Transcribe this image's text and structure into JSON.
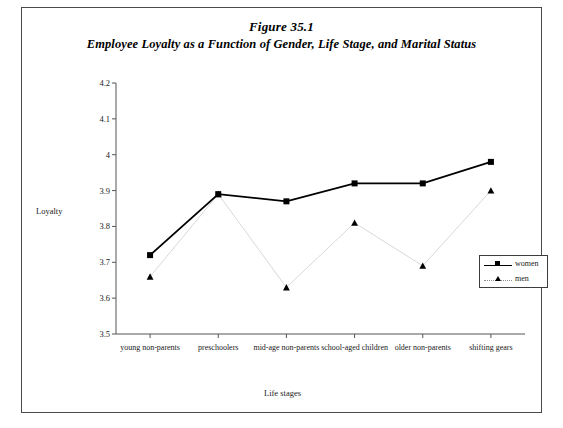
{
  "figure": {
    "title": "Figure 35.1",
    "subtitle": "Employee Loyalty as a Function of Gender, Life Stage, and Marital Status"
  },
  "chart_data": {
    "type": "line",
    "title": "Employee Loyalty as a Function of Gender, Life Stage, and Marital Status",
    "xlabel": "Life stages",
    "ylabel": "Loyalty",
    "ylim": [
      3.5,
      4.2
    ],
    "ytick_labels": [
      "4.2",
      "4.1",
      "4",
      "3.9",
      "3.8",
      "3.7",
      "3.6",
      "3.5"
    ],
    "ytick_values": [
      4.2,
      4.1,
      4.0,
      3.9,
      3.8,
      3.7,
      3.6,
      3.5
    ],
    "grid": false,
    "legend_position": "inside-right",
    "categories": [
      "young non-parents",
      "preschoolers",
      "mid-age non-parents",
      "school-aged children",
      "older non-parents",
      "shifting gears"
    ],
    "series": [
      {
        "name": "women",
        "marker": "square",
        "line_style": "solid",
        "color": "#000000",
        "values": [
          3.72,
          3.89,
          3.87,
          3.92,
          3.92,
          3.98
        ]
      },
      {
        "name": "men",
        "marker": "triangle",
        "line_style": "dotted",
        "color": "#000000",
        "values": [
          3.66,
          3.89,
          3.63,
          3.81,
          3.69,
          3.9
        ]
      }
    ]
  },
  "legend": {
    "entries": [
      {
        "label": "women"
      },
      {
        "label": "men"
      }
    ]
  }
}
